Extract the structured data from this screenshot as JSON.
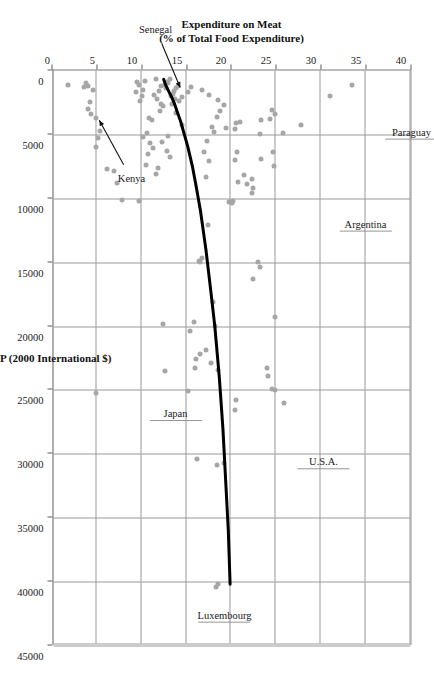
{
  "chart_data": {
    "type": "scatter",
    "title": "",
    "xlabel": "GDP per Capita, PPP (2000 International $)",
    "ylabel": "Expenditure on Meat\n(% of Total Food Expenditure)",
    "ylabel_line1": "Expenditure on Meat",
    "ylabel_line2": "(% of Total Food Expenditure)",
    "xlim": [
      0,
      45000
    ],
    "ylim": [
      0,
      40
    ],
    "xticks": [
      0,
      5000,
      10000,
      15000,
      20000,
      25000,
      30000,
      35000,
      40000,
      45000
    ],
    "xticklabels": [
      "0",
      "5000",
      "10000",
      "15000",
      "20000",
      "25000",
      "30000",
      "35000",
      "40000",
      "45000"
    ],
    "yticks": [
      0,
      5,
      10,
      15,
      20,
      25,
      30,
      35,
      40
    ],
    "yticklabels": [
      "0",
      "5",
      "10",
      "15",
      "20",
      "25",
      "30",
      "35",
      "40"
    ],
    "grid": true,
    "legend": "none",
    "orientation": "page-rotated-90-clockwise",
    "marker_color": "#a6a6a6",
    "trend_color": "#000000",
    "series": [
      {
        "name": "Countries",
        "points": [
          [
            1100,
            33.5
          ],
          [
            2000,
            31.0
          ],
          [
            4300,
            27.8
          ],
          [
            4900,
            25.8
          ],
          [
            26000,
            25.9
          ],
          [
            3100,
            24.6
          ],
          [
            3400,
            24.9
          ],
          [
            3800,
            24.3
          ],
          [
            6400,
            24.7
          ],
          [
            6900,
            23.3
          ],
          [
            7500,
            24.8
          ],
          [
            3900,
            23.4
          ],
          [
            5000,
            23.2
          ],
          [
            19300,
            24.9
          ],
          [
            24900,
            24.6
          ],
          [
            25000,
            24.9
          ],
          [
            23300,
            24.0
          ],
          [
            23900,
            24.1
          ],
          [
            15000,
            23.0
          ],
          [
            15400,
            23.2
          ],
          [
            16300,
            22.5
          ],
          [
            9200,
            22.5
          ],
          [
            9600,
            22.3
          ],
          [
            8900,
            21.8
          ],
          [
            8500,
            22.3
          ],
          [
            8200,
            21.4
          ],
          [
            8700,
            20.8
          ],
          [
            10200,
            20.2
          ],
          [
            10300,
            19.8
          ],
          [
            10400,
            20.1
          ],
          [
            4000,
            21.0
          ],
          [
            4100,
            20.6
          ],
          [
            4600,
            20.4
          ],
          [
            4500,
            19.5
          ],
          [
            6400,
            20.7
          ],
          [
            7000,
            20.4
          ],
          [
            25800,
            20.6
          ],
          [
            26600,
            20.5
          ],
          [
            30700,
            19.2
          ],
          [
            30900,
            18.5
          ],
          [
            40200,
            18.6
          ],
          [
            40400,
            18.3
          ],
          [
            23400,
            18.6
          ],
          [
            22900,
            17.8
          ],
          [
            20000,
            18.2
          ],
          [
            18100,
            18.0
          ],
          [
            12100,
            17.4
          ],
          [
            14700,
            16.8
          ],
          [
            15000,
            16.5
          ],
          [
            14900,
            16.4
          ],
          [
            21900,
            17.2
          ],
          [
            22200,
            16.5
          ],
          [
            22600,
            16.1
          ],
          [
            23300,
            16.0
          ],
          [
            20400,
            15.4
          ],
          [
            19700,
            15.9
          ],
          [
            25100,
            15.2
          ],
          [
            30400,
            16.2
          ],
          [
            8300,
            17.2
          ],
          [
            7100,
            17.5
          ],
          [
            6400,
            17.0
          ],
          [
            5500,
            17.3
          ],
          [
            4800,
            18.1
          ],
          [
            4400,
            17.9
          ],
          [
            3600,
            18.4
          ],
          [
            3200,
            18.8
          ],
          [
            2700,
            19.2
          ],
          [
            2300,
            18.6
          ],
          [
            1900,
            17.6
          ],
          [
            1500,
            16.8
          ],
          [
            1300,
            15.6
          ],
          [
            1700,
            15.2
          ],
          [
            2100,
            14.6
          ],
          [
            2400,
            14.2
          ],
          [
            1200,
            14.1
          ],
          [
            1400,
            13.9
          ],
          [
            1600,
            13.7
          ],
          [
            1800,
            13.5
          ],
          [
            2000,
            13.3
          ],
          [
            2200,
            13.8
          ],
          [
            2600,
            13.4
          ],
          [
            1000,
            13.0
          ],
          [
            1100,
            12.6
          ],
          [
            900,
            12.9
          ],
          [
            3300,
            13.9
          ],
          [
            4300,
            14.6
          ],
          [
            5100,
            13.0
          ],
          [
            5600,
            12.3
          ],
          [
            6300,
            12.9
          ],
          [
            6800,
            13.2
          ],
          [
            7600,
            11.9
          ],
          [
            6100,
            11.3
          ],
          [
            5700,
            11.0
          ],
          [
            4900,
            10.6
          ],
          [
            5200,
            10.2
          ],
          [
            6500,
            10.8
          ],
          [
            7400,
            10.5
          ],
          [
            8100,
            11.6
          ],
          [
            10200,
            9.8
          ],
          [
            10100,
            7.9
          ],
          [
            8800,
            7.3
          ],
          [
            7900,
            7.0
          ],
          [
            7700,
            6.2
          ],
          [
            6000,
            5.0
          ],
          [
            5300,
            5.2
          ],
          [
            4700,
            5.4
          ],
          [
            3700,
            5.0
          ],
          [
            3400,
            4.4
          ],
          [
            3000,
            4.1
          ],
          [
            2500,
            4.3
          ],
          [
            1500,
            4.6
          ],
          [
            1200,
            4.1
          ],
          [
            1000,
            3.8
          ],
          [
            1300,
            3.6
          ],
          [
            900,
            9.5
          ],
          [
            1100,
            9.8
          ],
          [
            1500,
            10.2
          ],
          [
            1700,
            9.4
          ],
          [
            2000,
            10.1
          ],
          [
            2400,
            9.9
          ],
          [
            1900,
            11.4
          ],
          [
            2200,
            11.8
          ],
          [
            2600,
            12.2
          ],
          [
            1600,
            12.0
          ],
          [
            3700,
            10.9
          ],
          [
            3900,
            11.2
          ],
          [
            700,
            11.6
          ],
          [
            800,
            10.4
          ],
          [
            25200,
            5.0
          ],
          [
            19800,
            12.4
          ],
          [
            23500,
            12.6
          ],
          [
            1100,
            1.8
          ],
          [
            700,
            13.2
          ],
          [
            1200,
            12.2
          ],
          [
            1400,
            12.8
          ],
          [
            2800,
            12.4
          ],
          [
            3200,
            12.1
          ]
        ]
      }
    ],
    "trendline": {
      "description": "power/logarithmic best fit curve",
      "points": [
        [
          40200,
          19.9
        ],
        [
          36000,
          19.7
        ],
        [
          32000,
          19.4
        ],
        [
          28000,
          19.1
        ],
        [
          24000,
          18.7
        ],
        [
          20000,
          18.2
        ],
        [
          17000,
          17.7
        ],
        [
          14000,
          17.2
        ],
        [
          11000,
          16.6
        ],
        [
          9000,
          16.1
        ],
        [
          7500,
          15.7
        ],
        [
          6000,
          15.2
        ],
        [
          5000,
          14.8
        ],
        [
          4000,
          14.4
        ],
        [
          3200,
          14.0
        ],
        [
          2600,
          13.7
        ],
        [
          2100,
          13.4
        ],
        [
          1700,
          13.1
        ],
        [
          1400,
          12.9
        ],
        [
          1100,
          12.7
        ],
        [
          900,
          12.6
        ],
        [
          700,
          12.5
        ]
      ]
    },
    "annotations": [
      {
        "label": "Paraguay",
        "kind": "leader",
        "x": 4900,
        "y": 33.5,
        "name": "annotation-paraguay"
      },
      {
        "label": "Argentina",
        "kind": "leader",
        "x": 12100,
        "y": 30.0,
        "name": "annotation-argentina"
      },
      {
        "label": "U.S.A.",
        "kind": "leader",
        "x": 30700,
        "y": 24.4,
        "name": "annotation-usa"
      },
      {
        "label": "Luxembourg",
        "kind": "leader",
        "x": 40200,
        "y": 16.0,
        "name": "annotation-luxembourg"
      },
      {
        "label": "Japan",
        "kind": "leader",
        "x": 25200,
        "y": 8.4,
        "name": "annotation-japan"
      },
      {
        "label": "Kenya",
        "kind": "arrow",
        "x": 3700,
        "y": 5.0,
        "name": "annotation-kenya"
      },
      {
        "label": "Senegal",
        "kind": "arrow",
        "x": 1700,
        "y": 14.4,
        "name": "annotation-senegal"
      }
    ]
  }
}
